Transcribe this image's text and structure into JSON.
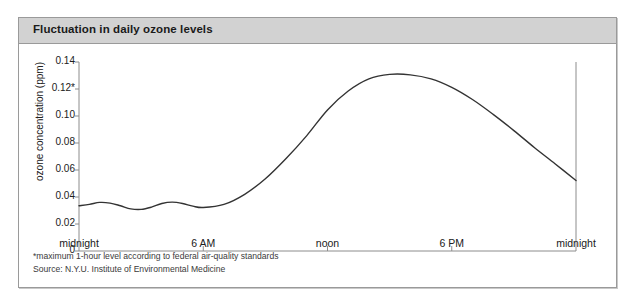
{
  "figure": {
    "title": "Fluctuation in daily ozone levels",
    "footnotes": [
      "*maximum 1-hour level according to federal air-quality standards",
      "Source:  N.Y.U. Institute of Environmental Medicine"
    ],
    "frame_color": "#9a9a9a",
    "title_bar_color": "#d2d2d2",
    "line_color": "#333333",
    "axis_color": "#8c8c8c"
  },
  "chart_data": {
    "type": "line",
    "title": "Fluctuation in daily ozone levels",
    "xlabel": "",
    "ylabel": "ozone concentration (ppm)",
    "ylim": [
      0,
      0.14
    ],
    "xlim": [
      0,
      24
    ],
    "grid": false,
    "legend": null,
    "ytick_labels": [
      "0",
      "0.02",
      "0.04",
      "0.06",
      "0.08",
      "0.10",
      "0.12*",
      "0.14"
    ],
    "ytick_values": [
      0,
      0.02,
      0.04,
      0.06,
      0.08,
      0.1,
      0.12,
      0.14
    ],
    "xtick_labels": [
      "midnight",
      "6 AM",
      "noon",
      "6 PM",
      "midnight"
    ],
    "xtick_values": [
      0,
      6,
      12,
      18,
      24
    ],
    "annotations": [
      "*maximum 1-hour level according to federal air-quality standards"
    ],
    "series": [
      {
        "name": "ozone concentration",
        "x": [
          0,
          0.5,
          1,
          1.5,
          2,
          2.5,
          3,
          3.5,
          4,
          4.5,
          5,
          5.5,
          6,
          7,
          8,
          9,
          10,
          11,
          12,
          13,
          14,
          15,
          16,
          17,
          18,
          19,
          20,
          21,
          22,
          23,
          24
        ],
        "values": [
          0.0335,
          0.0345,
          0.036,
          0.0355,
          0.0335,
          0.0312,
          0.0308,
          0.0325,
          0.0352,
          0.0362,
          0.0352,
          0.0332,
          0.0322,
          0.0345,
          0.042,
          0.0535,
          0.0685,
          0.0855,
          0.1045,
          0.1185,
          0.1275,
          0.1308,
          0.1305,
          0.1275,
          0.1212,
          0.1122,
          0.1012,
          0.0892,
          0.0765,
          0.0645,
          0.0522
        ]
      }
    ]
  }
}
